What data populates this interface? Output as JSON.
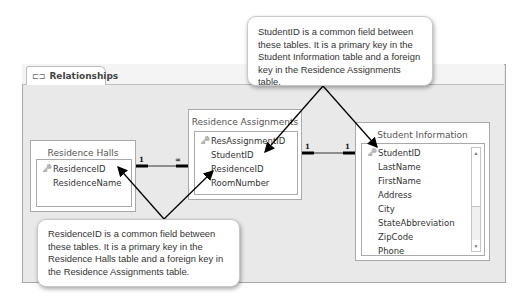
{
  "window": {
    "tab_label": "Relationships",
    "tab_icon": "relationships-icon"
  },
  "tables": {
    "residence_halls": {
      "title": "Residence Halls",
      "fields": [
        {
          "name": "ResidenceID",
          "primary_key": true
        },
        {
          "name": "ResidenceName",
          "primary_key": false
        }
      ]
    },
    "residence_assignments": {
      "title": "Residence Assignments",
      "fields": [
        {
          "name": "ResAssignmentID",
          "primary_key": true
        },
        {
          "name": "StudentID",
          "primary_key": false
        },
        {
          "name": "ResidenceID",
          "primary_key": false
        },
        {
          "name": "RoomNumber",
          "primary_key": false
        }
      ]
    },
    "student_information": {
      "title": "Student Information",
      "fields": [
        {
          "name": "StudentID",
          "primary_key": true
        },
        {
          "name": "LastName",
          "primary_key": false
        },
        {
          "name": "FirstName",
          "primary_key": false
        },
        {
          "name": "Address",
          "primary_key": false
        },
        {
          "name": "City",
          "primary_key": false
        },
        {
          "name": "StateAbbreviation",
          "primary_key": false
        },
        {
          "name": "ZipCode",
          "primary_key": false
        },
        {
          "name": "Phone",
          "primary_key": false
        }
      ]
    }
  },
  "relationships": [
    {
      "from": "Residence Halls.ResidenceID",
      "to": "Residence Assignments.ResidenceID",
      "from_card": "1",
      "to_card": "∞"
    },
    {
      "from": "Residence Assignments.StudentID",
      "to": "Student Information.StudentID",
      "from_card": "1",
      "to_card": "1"
    }
  ],
  "callouts": {
    "top": "StudentID is a common field between these tables. It is a primary key in the Student Information table and a foreign key in the Residence Assignments table.",
    "bottom": "ResidenceID is a common field between these tables. It is a primary key in the Residence Halls table and a foreign key in the Residence Assignments table."
  },
  "colors": {
    "panel_bg": "#e9e9e9",
    "border": "#a9a9a9",
    "line": "#000000"
  }
}
